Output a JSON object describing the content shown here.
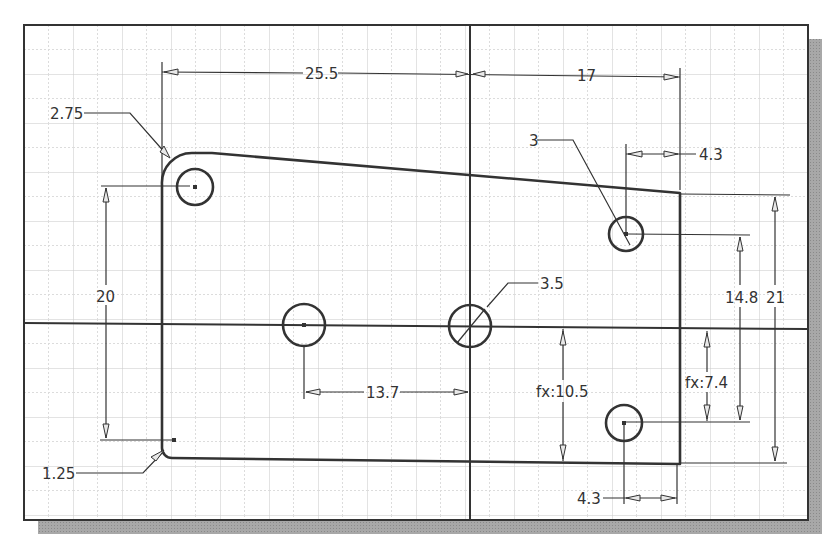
{
  "sketch": {
    "frame": {
      "x": 24,
      "y": 25,
      "width": 784,
      "height": 495,
      "shadow_offset": 14,
      "shadow_color": "#9a9a9a",
      "border_color": "#333333",
      "background": "#ffffff"
    },
    "grid": {
      "spacing": 24.5,
      "major_color": "#c8c8c8",
      "minor_color": "#dcdcdc"
    },
    "axes": {
      "horizontal_y": 325,
      "vertical_x": 470
    },
    "profile": {
      "description": "Plate outline with sloped top edge, R2.75 top-left fillet and R1.25 bottom-left fillet",
      "line_color": "#333333"
    },
    "holes": [
      {
        "id": "hole-top-left",
        "cx": 195,
        "cy": 187,
        "r": 19
      },
      {
        "id": "hole-center-left",
        "cx": 304,
        "cy": 325,
        "r": 21
      },
      {
        "id": "hole-origin",
        "cx": 470,
        "cy": 325,
        "r": 21
      },
      {
        "id": "hole-top-right",
        "cx": 626,
        "cy": 234,
        "r": 18
      },
      {
        "id": "hole-bottom-right",
        "cx": 624,
        "cy": 422,
        "r": 18
      }
    ],
    "dimensions": [
      {
        "id": "dim-width-left",
        "label": "25.5",
        "type": "linear-horizontal"
      },
      {
        "id": "dim-width-right",
        "label": "17",
        "type": "linear-horizontal"
      },
      {
        "id": "dim-fillet-top",
        "label": "2.75",
        "type": "radius"
      },
      {
        "id": "dim-hole-dia-right",
        "label": "3",
        "type": "diameter"
      },
      {
        "id": "dim-hole-offset-top",
        "label": "4.3",
        "type": "linear-horizontal"
      },
      {
        "id": "dim-height-left",
        "label": "20",
        "type": "linear-vertical"
      },
      {
        "id": "dim-hole-dia-origin",
        "label": "3.5",
        "type": "diameter"
      },
      {
        "id": "dim-hole-spacing",
        "label": "13.7",
        "type": "linear-horizontal"
      },
      {
        "id": "dim-fx-105",
        "label": "fx:10.5",
        "type": "driven-vertical"
      },
      {
        "id": "dim-fx-74",
        "label": "fx:7.4",
        "type": "driven-vertical"
      },
      {
        "id": "dim-148",
        "label": "14.8",
        "type": "linear-vertical"
      },
      {
        "id": "dim-21",
        "label": "21",
        "type": "linear-vertical"
      },
      {
        "id": "dim-fillet-bottom",
        "label": "1.25",
        "type": "radius"
      },
      {
        "id": "dim-hole-offset-bottom",
        "label": "4.3",
        "type": "linear-horizontal"
      }
    ]
  }
}
